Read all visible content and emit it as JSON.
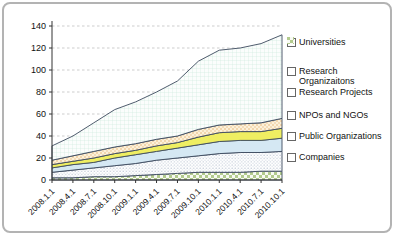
{
  "chart_data": {
    "type": "area",
    "stacked": true,
    "title": "",
    "xlabel": "",
    "ylabel": "",
    "categories": [
      "2008.1.1",
      "2008.4.1",
      "2008.7.1",
      "2008.10.1",
      "2009.1.1",
      "2009.4.1",
      "2009.7.1",
      "2009.10.1",
      "2010.1.1",
      "2010.4.1",
      "2010.7.1",
      "2010.10.1"
    ],
    "y_axis": {
      "min": 0,
      "max": 140,
      "step": 20,
      "ticks": [
        0,
        20,
        40,
        60,
        80,
        100,
        120,
        140
      ]
    },
    "grid": "dashed-horizontal",
    "series_bottom_to_top": [
      {
        "name": "Companies",
        "pattern": "checker-green",
        "fill": "#b3cb8e",
        "values": [
          2,
          2,
          3,
          3,
          4,
          5,
          6,
          7,
          7,
          7,
          8,
          8
        ]
      },
      {
        "name": "Public Organizations",
        "pattern": "dots-gray",
        "fill": "#ffffff",
        "values": [
          5,
          7,
          8,
          10,
          11,
          13,
          14,
          15,
          17,
          18,
          17,
          18
        ]
      },
      {
        "name": "NPOs and NGOs",
        "pattern": "solid",
        "fill": "#d5e8f3",
        "values": [
          4,
          5,
          5,
          7,
          8,
          8,
          9,
          10,
          11,
          11,
          11,
          12
        ]
      },
      {
        "name": "Research Projects",
        "pattern": "solid",
        "fill": "#efee62",
        "values": [
          3,
          3,
          4,
          4,
          4,
          5,
          5,
          7,
          8,
          8,
          8,
          9
        ]
      },
      {
        "name": "Research Organizaitons",
        "pattern": "dots-orange",
        "fill": "#fcf1d9",
        "values": [
          4,
          5,
          6,
          6,
          6,
          6,
          6,
          7,
          7,
          7,
          8,
          9
        ]
      },
      {
        "name": "Universities",
        "pattern": "grid-teal",
        "fill": "#fbfdfc",
        "values": [
          13,
          18,
          26,
          34,
          38,
          43,
          50,
          62,
          68,
          69,
          72,
          76
        ]
      }
    ],
    "stacked_totals": [
      31,
      40,
      52,
      64,
      71,
      80,
      90,
      108,
      118,
      120,
      124,
      132
    ],
    "legend": {
      "position": "right",
      "order_top_to_bottom": [
        "Universities",
        "Research Organizaitons",
        "Research Projects",
        "NPOs and NGOs",
        "Public Organizations",
        "Companies"
      ]
    },
    "colors": {
      "outline": "#3c4a5e",
      "gridline": "#ababab",
      "axis": "#333333",
      "text": "#111111"
    }
  }
}
